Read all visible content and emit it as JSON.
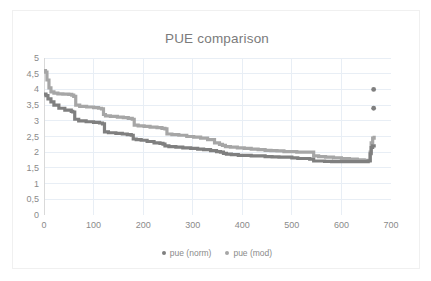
{
  "chart_data": {
    "type": "line",
    "title": "PUE comparison",
    "xlabel": "",
    "ylabel": "",
    "xlim": [
      0,
      700
    ],
    "ylim": [
      0,
      5
    ],
    "grid": true,
    "legend_position": "bottom",
    "xticks": [
      "0",
      "100",
      "200",
      "300",
      "400",
      "500",
      "600",
      "700"
    ],
    "xtick_values": [
      0,
      100,
      200,
      300,
      400,
      500,
      600,
      700
    ],
    "yticks": [
      "0",
      "0,5",
      "1",
      "1,5",
      "2",
      "2,5",
      "3",
      "3,5",
      "4",
      "4,5",
      "5"
    ],
    "ytick_values": [
      0,
      0.5,
      1,
      1.5,
      2,
      2.5,
      3,
      3.5,
      4,
      4.5,
      5
    ],
    "colors": {
      "series_norm": "#7f7f7f",
      "series_mod": "#a6a6a6",
      "grid": "#e8eef5",
      "axis": "#d9d9d9",
      "text": "#8a8a8a",
      "frame": "#f0f0f0"
    },
    "series": [
      {
        "name": "pue (norm)",
        "color": "#7f7f7f",
        "marker": "dot",
        "x": [
          0,
          4,
          8,
          14,
          20,
          30,
          42,
          55,
          58,
          62,
          70,
          85,
          100,
          112,
          118,
          122,
          130,
          145,
          158,
          168,
          176,
          180,
          186,
          196,
          208,
          222,
          234,
          240,
          244,
          252,
          266,
          280,
          296,
          310,
          322,
          336,
          348,
          356,
          362,
          368,
          378,
          392,
          404,
          418,
          432,
          446,
          460,
          474,
          488,
          500,
          512,
          524,
          536,
          544,
          552,
          566,
          580,
          596,
          612,
          628,
          644,
          654,
          658,
          660,
          663,
          666
        ],
        "y": [
          3.85,
          3.8,
          3.7,
          3.6,
          3.5,
          3.4,
          3.34,
          3.3,
          3.28,
          3.05,
          3.0,
          2.97,
          2.95,
          2.93,
          2.9,
          2.65,
          2.62,
          2.6,
          2.58,
          2.56,
          2.54,
          2.42,
          2.4,
          2.38,
          2.34,
          2.3,
          2.28,
          2.26,
          2.2,
          2.18,
          2.16,
          2.14,
          2.12,
          2.1,
          2.08,
          2.05,
          2.02,
          2.0,
          1.96,
          1.94,
          1.92,
          1.9,
          1.9,
          1.88,
          1.88,
          1.86,
          1.85,
          1.84,
          1.84,
          1.82,
          1.8,
          1.8,
          1.78,
          1.72,
          1.72,
          1.71,
          1.7,
          1.7,
          1.7,
          1.7,
          1.7,
          1.72,
          1.95,
          2.15,
          2.2,
          2.25
        ]
      },
      {
        "name": "pue (mod)",
        "color": "#a6a6a6",
        "marker": "dot",
        "x": [
          0,
          3,
          6,
          10,
          14,
          20,
          28,
          38,
          50,
          56,
          60,
          64,
          72,
          86,
          100,
          110,
          116,
          120,
          124,
          134,
          148,
          160,
          170,
          178,
          182,
          190,
          202,
          214,
          228,
          238,
          244,
          248,
          258,
          272,
          288,
          302,
          316,
          330,
          344,
          354,
          360,
          366,
          376,
          390,
          404,
          418,
          432,
          446,
          458,
          470,
          484,
          498,
          510,
          522,
          534,
          544,
          554,
          568,
          584,
          600,
          616,
          632,
          646,
          654,
          658,
          660,
          663,
          666
        ],
        "y": [
          4.6,
          4.55,
          4.3,
          4.05,
          3.92,
          3.88,
          3.86,
          3.85,
          3.84,
          3.82,
          3.78,
          3.5,
          3.46,
          3.44,
          3.42,
          3.4,
          3.38,
          3.2,
          3.16,
          3.14,
          3.12,
          3.1,
          3.08,
          3.05,
          2.86,
          2.84,
          2.82,
          2.8,
          2.78,
          2.76,
          2.74,
          2.58,
          2.56,
          2.54,
          2.5,
          2.48,
          2.45,
          2.4,
          2.3,
          2.25,
          2.22,
          2.18,
          2.16,
          2.14,
          2.12,
          2.1,
          2.08,
          2.06,
          2.05,
          2.04,
          2.02,
          2.02,
          2.0,
          2.0,
          2.0,
          1.88,
          1.86,
          1.84,
          1.82,
          1.8,
          1.78,
          1.76,
          1.74,
          1.74,
          2.0,
          2.3,
          2.45,
          2.52
        ]
      }
    ],
    "annotations": [
      {
        "name": "isolated-point-upper",
        "x": 665,
        "y": 4.0,
        "color": "#7f7f7f"
      },
      {
        "name": "isolated-point-lower",
        "x": 665,
        "y": 3.4,
        "color": "#7f7f7f"
      }
    ],
    "legend": [
      {
        "label": "pue (norm)",
        "color": "#7f7f7f"
      },
      {
        "label": "pue (mod)",
        "color": "#a6a6a6"
      }
    ]
  }
}
